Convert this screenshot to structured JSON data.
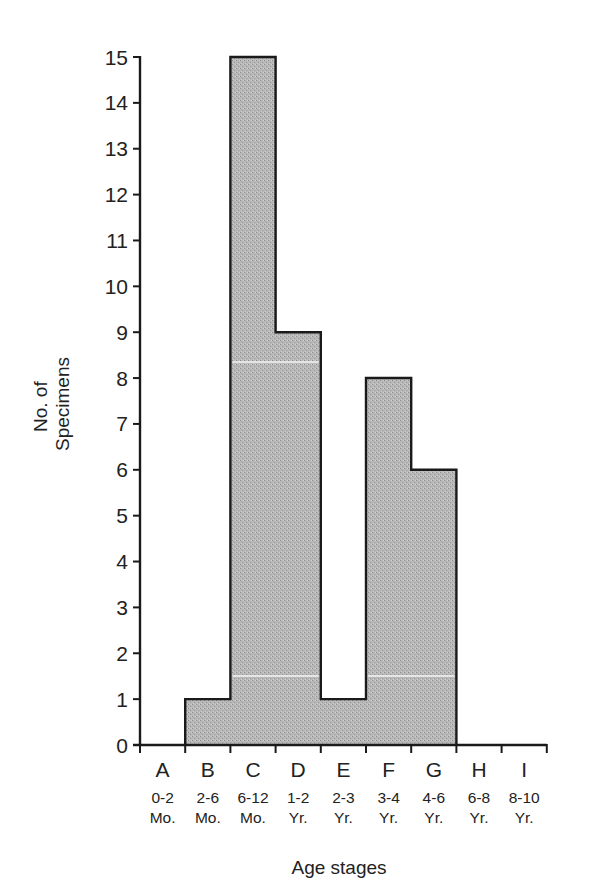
{
  "chart_data": {
    "type": "bar",
    "style": "histogram (contiguous bars, stepped outline)",
    "title": "",
    "xlabel": "Age stages",
    "ylabel": [
      "No. of",
      "Specimens"
    ],
    "ylim": [
      0,
      15
    ],
    "yticks": [
      0,
      1,
      2,
      3,
      4,
      5,
      6,
      7,
      8,
      9,
      10,
      11,
      12,
      13,
      14,
      15
    ],
    "grid": false,
    "legend": null,
    "categories": [
      "A",
      "B",
      "C",
      "D",
      "E",
      "F",
      "G",
      "H",
      "I"
    ],
    "category_ranges": [
      "0-2",
      "2-6",
      "6-12",
      "1-2",
      "2-3",
      "3-4",
      "4-6",
      "6-8",
      "8-10"
    ],
    "category_units": [
      "Mo.",
      "Mo.",
      "Mo.",
      "Yr.",
      "Yr.",
      "Yr.",
      "Yr.",
      "Yr.",
      "Yr."
    ],
    "values": [
      0,
      1,
      15,
      9,
      1,
      8,
      6,
      0,
      0
    ],
    "fill_color": "#b4b4b4",
    "outline_color": "#1a1a1a"
  }
}
